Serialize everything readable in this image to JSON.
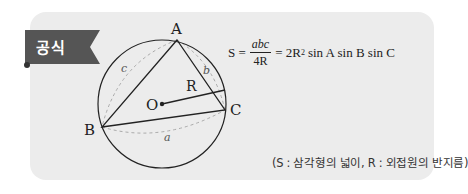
{
  "tab": {
    "label": "공식",
    "color": "#555555"
  },
  "figure": {
    "vertices": {
      "A": "A",
      "B": "B",
      "C": "C"
    },
    "center_label": "O",
    "radius_label": "R",
    "side_labels": {
      "a": "a",
      "b": "b",
      "c": "c"
    }
  },
  "formula": {
    "lhs": "S =",
    "frac_num": "abc",
    "frac_den": "4R",
    "eq2": "= 2R",
    "exp": "2",
    "rhs": "sin A sin B sin C"
  },
  "note": "(S : 삼각형의 넓이, R : 외접원의 반지름)",
  "colors": {
    "panel": "#ececec",
    "tab": "#555555",
    "ink": "#222222",
    "dashed": "#aaaaaa"
  }
}
